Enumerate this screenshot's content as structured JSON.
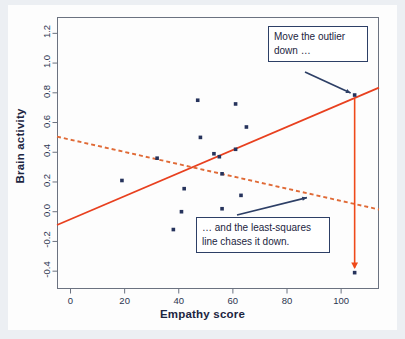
{
  "chart_data": {
    "type": "scatter",
    "title": "",
    "xlabel": "Empathy score",
    "ylabel": "Brain activity",
    "xlim": [
      -5,
      114
    ],
    "ylim": [
      -0.52,
      1.31
    ],
    "xticks": [
      0,
      20,
      40,
      60,
      80,
      100
    ],
    "yticks": [
      -0.4,
      -0.2,
      0.0,
      0.2,
      0.4,
      0.6,
      0.8,
      1.0,
      1.2
    ],
    "xticklabels": [
      "0",
      "20",
      "40",
      "60",
      "80",
      "100"
    ],
    "yticklabels": [
      "-0.4",
      "-0.2",
      "0.0",
      "0.2",
      "0.4",
      "0.6",
      "0.8",
      "1.0",
      "1.2"
    ],
    "grid": false,
    "legend": false,
    "point_color": "#26335c",
    "series": [
      {
        "name": "Observations",
        "type": "scatter",
        "points": [
          {
            "x": 19,
            "y": 0.21
          },
          {
            "x": 32,
            "y": 0.36
          },
          {
            "x": 38,
            "y": -0.12
          },
          {
            "x": 41,
            "y": 0.0
          },
          {
            "x": 42,
            "y": 0.155
          },
          {
            "x": 47,
            "y": 0.75
          },
          {
            "x": 48,
            "y": 0.5
          },
          {
            "x": 53,
            "y": 0.39
          },
          {
            "x": 55,
            "y": 0.37
          },
          {
            "x": 56,
            "y": 0.255
          },
          {
            "x": 56,
            "y": 0.02
          },
          {
            "x": 61,
            "y": 0.725
          },
          {
            "x": 61,
            "y": 0.42
          },
          {
            "x": 63,
            "y": 0.11
          },
          {
            "x": 65,
            "y": 0.57
          },
          {
            "x": 105,
            "y": 0.785
          },
          {
            "x": 105,
            "y": -0.41
          }
        ]
      },
      {
        "name": "Least-squares line (original)",
        "type": "line",
        "style": "solid",
        "color": "#e8401f",
        "endpoints": [
          {
            "x": -5,
            "y": -0.09
          },
          {
            "x": 114,
            "y": 0.835
          }
        ]
      },
      {
        "name": "Least-squares line (after moving outlier)",
        "type": "line",
        "style": "dashed",
        "color": "#e06a36",
        "endpoints": [
          {
            "x": -5,
            "y": 0.505
          },
          {
            "x": 114,
            "y": 0.015
          }
        ]
      },
      {
        "name": "Outlier move arrow",
        "type": "arrow",
        "color": "#ef4a1a",
        "from": {
          "x": 105,
          "y": 0.76
        },
        "to": {
          "x": 105,
          "y": -0.375
        }
      }
    ],
    "annotations": [
      {
        "name": "move-outlier",
        "text": "Move the outlier down …",
        "lines": [
          "Move the outlier",
          "down …"
        ],
        "box_color": "#2d3f66",
        "arrow_color": "#2d3f66",
        "points_to": {
          "x": 105,
          "y": 0.785
        }
      },
      {
        "name": "least-squares-chases",
        "text": "… and the least-squares line chases it down.",
        "lines": [
          "… and the least-squares",
          "line chases it down."
        ],
        "box_color": "#2d3f66",
        "arrow_color": "#2d3f66",
        "points_to": {
          "x": 87,
          "y": 0.115
        }
      }
    ]
  },
  "axis": {
    "xlabel": "Empathy score",
    "ylabel": "Brain activity"
  },
  "annotations": {
    "outlier": {
      "line1": "Move the outlier",
      "line2": "down …"
    },
    "leastsquares": {
      "line1": "… and the least-squares",
      "line2": "line chases it down."
    }
  }
}
